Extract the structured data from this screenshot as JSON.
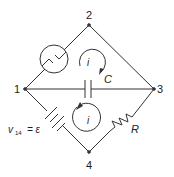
{
  "diagram": {
    "type": "circuit",
    "nodes": [
      {
        "id": "1",
        "label": "1",
        "x": 25,
        "y": 89
      },
      {
        "id": "2",
        "label": "2",
        "x": 89,
        "y": 25
      },
      {
        "id": "3",
        "label": "3",
        "x": 154,
        "y": 89
      },
      {
        "id": "4",
        "label": "4",
        "x": 89,
        "y": 152
      }
    ],
    "branches": [
      {
        "from": "1",
        "to": "2",
        "element": "current-source"
      },
      {
        "from": "2",
        "to": "3",
        "element": "wire"
      },
      {
        "from": "1",
        "to": "3",
        "element": "capacitor",
        "label": "C"
      },
      {
        "from": "1",
        "to": "4",
        "element": "battery",
        "label": "v14 = ε"
      },
      {
        "from": "4",
        "to": "3",
        "element": "resistor",
        "label": "R"
      }
    ],
    "loops": [
      {
        "name": "upper-loop",
        "label": "i",
        "direction": "clockwise"
      },
      {
        "name": "lower-loop",
        "label": "i",
        "direction": "clockwise"
      }
    ],
    "labels": {
      "node1": "1",
      "node2": "2",
      "node3": "3",
      "node4": "4",
      "capacitor": "C",
      "resistor": "R",
      "loop_upper": "i",
      "loop_lower": "i",
      "battery_v": "v",
      "battery_sub": "14",
      "battery_eq": "= ε"
    }
  }
}
